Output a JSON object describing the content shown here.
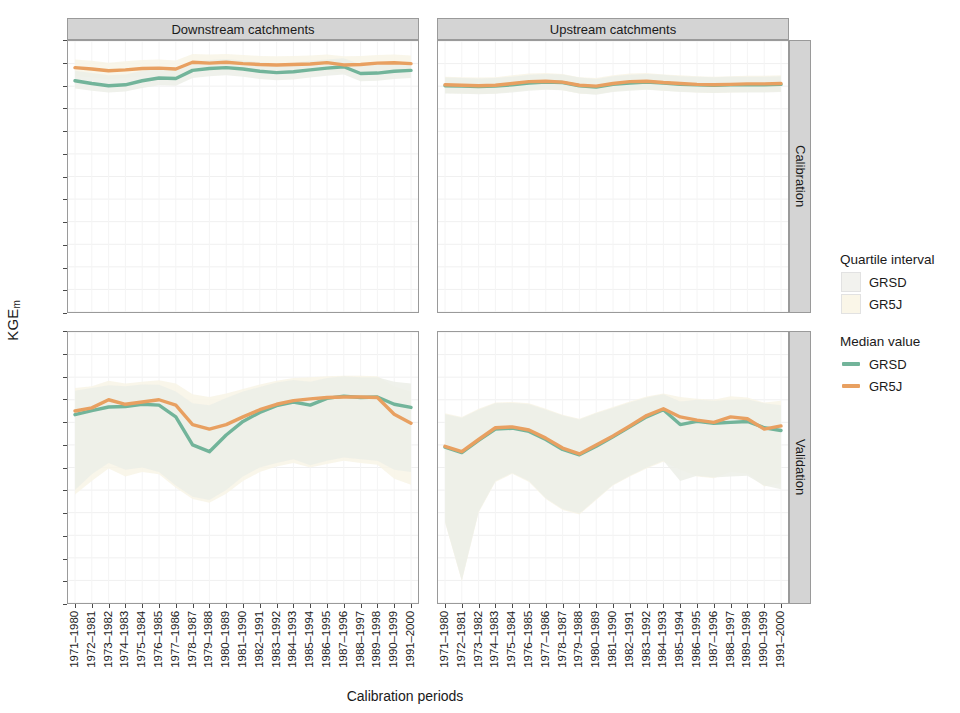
{
  "axes": {
    "ylabel_main": "KGE",
    "ylabel_sub": "m",
    "xlabel": "Calibration periods"
  },
  "strips": {
    "columns": [
      "Downstream catchments",
      "Upstream catchments"
    ],
    "rows": [
      "Calibration",
      "Validation"
    ]
  },
  "legend": {
    "quartile_title": "Quartile interval",
    "quartile_items": [
      {
        "label": "GRSD",
        "color": "#f2f2ee"
      },
      {
        "label": "GR5J",
        "color": "#faf6e8"
      }
    ],
    "median_title": "Median value",
    "median_items": [
      {
        "label": "GRSD",
        "color": "#72b49a"
      },
      {
        "label": "GR5J",
        "color": "#e8a061"
      }
    ]
  },
  "chart_data": {
    "type": "line",
    "title": "",
    "xlabel": "Calibration periods",
    "ylabel": "KGEm",
    "ylim": [
      0.35,
      0.95
    ],
    "yticks": [
      0.95,
      0.9,
      0.85,
      0.8,
      0.75,
      0.7,
      0.65,
      0.6,
      0.55,
      0.5,
      0.45,
      0.4,
      0.35
    ],
    "ytick_labels": [
      "0.95",
      "0.90",
      "0.85",
      "0.80",
      "0.75",
      "0.70",
      "0.65",
      "0.60",
      "0.55",
      "0.50",
      "0.45",
      "0.40",
      "0.35"
    ],
    "grid": true,
    "legend_position": "right",
    "categories": [
      "1971–1980",
      "1972–1981",
      "1973–1982",
      "1974–1983",
      "1975–1984",
      "1976–1985",
      "1977–1986",
      "1978–1987",
      "1979–1988",
      "1980–1989",
      "1981–1990",
      "1982–1991",
      "1983–1992",
      "1984–1993",
      "1985–1994",
      "1986–1995",
      "1987–1996",
      "1988–1997",
      "1989–1998",
      "1990–1999",
      "1991–2000"
    ],
    "panels": [
      {
        "row": "Calibration",
        "column": "Downstream catchments",
        "series": [
          {
            "name": "GRSD",
            "kind": "median",
            "color": "#72b49a",
            "values": [
              0.862,
              0.856,
              0.851,
              0.853,
              0.862,
              0.868,
              0.867,
              0.885,
              0.889,
              0.891,
              0.888,
              0.883,
              0.88,
              0.882,
              0.886,
              0.89,
              0.893,
              0.878,
              0.879,
              0.883,
              0.885
            ],
            "q1": [
              0.845,
              0.84,
              0.836,
              0.838,
              0.846,
              0.852,
              0.851,
              0.868,
              0.872,
              0.874,
              0.871,
              0.866,
              0.863,
              0.865,
              0.869,
              0.873,
              0.876,
              0.861,
              0.862,
              0.866,
              0.868
            ],
            "q3": [
              0.884,
              0.879,
              0.874,
              0.876,
              0.884,
              0.89,
              0.889,
              0.905,
              0.908,
              0.91,
              0.907,
              0.903,
              0.9,
              0.902,
              0.906,
              0.909,
              0.912,
              0.898,
              0.899,
              0.902,
              0.904
            ]
          },
          {
            "name": "GR5J",
            "kind": "median",
            "color": "#e8a061",
            "values": [
              0.891,
              0.888,
              0.884,
              0.886,
              0.889,
              0.89,
              0.888,
              0.903,
              0.901,
              0.903,
              0.9,
              0.898,
              0.897,
              0.898,
              0.899,
              0.902,
              0.897,
              0.898,
              0.901,
              0.902,
              0.9
            ],
            "q1": [
              0.872,
              0.869,
              0.865,
              0.868,
              0.871,
              0.872,
              0.87,
              0.885,
              0.883,
              0.885,
              0.882,
              0.88,
              0.879,
              0.88,
              0.881,
              0.884,
              0.879,
              0.88,
              0.883,
              0.884,
              0.882
            ],
            "q3": [
              0.909,
              0.906,
              0.902,
              0.905,
              0.908,
              0.909,
              0.907,
              0.921,
              0.92,
              0.921,
              0.919,
              0.917,
              0.916,
              0.917,
              0.918,
              0.92,
              0.916,
              0.917,
              0.919,
              0.92,
              0.918
            ]
          }
        ]
      },
      {
        "row": "Calibration",
        "column": "Upstream catchments",
        "series": [
          {
            "name": "GRSD",
            "kind": "median",
            "color": "#72b49a",
            "values": [
              0.851,
              0.85,
              0.849,
              0.85,
              0.853,
              0.857,
              0.859,
              0.858,
              0.851,
              0.848,
              0.854,
              0.857,
              0.859,
              0.857,
              0.854,
              0.853,
              0.852,
              0.853,
              0.853,
              0.853,
              0.854
            ],
            "q1": [
              0.834,
              0.833,
              0.832,
              0.833,
              0.836,
              0.84,
              0.842,
              0.841,
              0.834,
              0.831,
              0.837,
              0.84,
              0.842,
              0.84,
              0.837,
              0.836,
              0.835,
              0.836,
              0.836,
              0.836,
              0.837
            ],
            "q3": [
              0.869,
              0.868,
              0.867,
              0.868,
              0.871,
              0.875,
              0.877,
              0.876,
              0.869,
              0.866,
              0.872,
              0.875,
              0.877,
              0.875,
              0.872,
              0.871,
              0.87,
              0.871,
              0.871,
              0.871,
              0.872
            ]
          },
          {
            "name": "GR5J",
            "kind": "median",
            "color": "#e8a061",
            "values": [
              0.853,
              0.852,
              0.851,
              0.852,
              0.856,
              0.86,
              0.861,
              0.859,
              0.852,
              0.85,
              0.856,
              0.86,
              0.861,
              0.858,
              0.856,
              0.854,
              0.853,
              0.854,
              0.855,
              0.855,
              0.856
            ],
            "q1": [
              0.835,
              0.834,
              0.833,
              0.834,
              0.838,
              0.842,
              0.843,
              0.841,
              0.834,
              0.832,
              0.838,
              0.842,
              0.843,
              0.84,
              0.838,
              0.836,
              0.835,
              0.836,
              0.837,
              0.837,
              0.838
            ],
            "q3": [
              0.871,
              0.87,
              0.869,
              0.87,
              0.874,
              0.878,
              0.879,
              0.877,
              0.87,
              0.868,
              0.874,
              0.878,
              0.879,
              0.876,
              0.874,
              0.872,
              0.871,
              0.872,
              0.873,
              0.873,
              0.874
            ]
          }
        ]
      },
      {
        "row": "Validation",
        "column": "Downstream catchments",
        "series": [
          {
            "name": "GRSD",
            "kind": "median",
            "color": "#72b49a",
            "values": [
              0.767,
              0.776,
              0.784,
              0.785,
              0.79,
              0.788,
              0.762,
              0.7,
              0.685,
              0.722,
              0.752,
              0.772,
              0.787,
              0.795,
              0.788,
              0.803,
              0.808,
              0.805,
              0.806,
              0.79,
              0.783
            ],
            "q1": [
              0.6,
              0.635,
              0.66,
              0.645,
              0.65,
              0.64,
              0.61,
              0.585,
              0.578,
              0.6,
              0.63,
              0.65,
              0.66,
              0.668,
              0.655,
              0.665,
              0.672,
              0.668,
              0.665,
              0.645,
              0.64
            ],
            "q3": [
              0.82,
              0.826,
              0.832,
              0.83,
              0.834,
              0.833,
              0.818,
              0.792,
              0.788,
              0.804,
              0.818,
              0.828,
              0.838,
              0.844,
              0.84,
              0.848,
              0.852,
              0.85,
              0.85,
              0.84,
              0.836
            ]
          },
          {
            "name": "GR5J",
            "kind": "median",
            "color": "#e8a061",
            "values": [
              0.775,
              0.782,
              0.8,
              0.79,
              0.795,
              0.8,
              0.788,
              0.745,
              0.735,
              0.745,
              0.762,
              0.778,
              0.79,
              0.798,
              0.802,
              0.805,
              0.806,
              0.806,
              0.805,
              0.768,
              0.748
            ],
            "q1": [
              0.59,
              0.62,
              0.648,
              0.63,
              0.64,
              0.635,
              0.605,
              0.58,
              0.572,
              0.592,
              0.62,
              0.64,
              0.652,
              0.66,
              0.65,
              0.658,
              0.665,
              0.66,
              0.656,
              0.625,
              0.612
            ],
            "q3": [
              0.826,
              0.83,
              0.842,
              0.836,
              0.84,
              0.843,
              0.836,
              0.812,
              0.806,
              0.814,
              0.824,
              0.834,
              0.842,
              0.848,
              0.85,
              0.852,
              0.853,
              0.853,
              0.852,
              0.83,
              0.818
            ]
          }
        ]
      },
      {
        "row": "Validation",
        "column": "Upstream catchments",
        "series": [
          {
            "name": "GRSD",
            "kind": "median",
            "color": "#72b49a",
            "values": [
              0.695,
              0.683,
              0.71,
              0.735,
              0.737,
              0.73,
              0.712,
              0.69,
              0.678,
              0.697,
              0.718,
              0.74,
              0.762,
              0.778,
              0.745,
              0.752,
              0.748,
              0.75,
              0.752,
              0.738,
              0.732
            ],
            "q1": [
              0.53,
              0.4,
              0.552,
              0.62,
              0.638,
              0.62,
              0.582,
              0.558,
              0.548,
              0.58,
              0.612,
              0.632,
              0.65,
              0.665,
              0.62,
              0.632,
              0.628,
              0.63,
              0.632,
              0.61,
              0.602
            ],
            "q3": [
              0.768,
              0.76,
              0.778,
              0.792,
              0.793,
              0.79,
              0.778,
              0.765,
              0.756,
              0.77,
              0.782,
              0.794,
              0.805,
              0.812,
              0.796,
              0.8,
              0.798,
              0.8,
              0.801,
              0.792,
              0.788
            ]
          },
          {
            "name": "GR5J",
            "kind": "median",
            "color": "#e8a061",
            "values": [
              0.697,
              0.685,
              0.712,
              0.738,
              0.74,
              0.733,
              0.715,
              0.693,
              0.68,
              0.7,
              0.72,
              0.742,
              0.765,
              0.78,
              0.762,
              0.755,
              0.75,
              0.762,
              0.758,
              0.735,
              0.742
            ],
            "q1": [
              0.528,
              0.398,
              0.55,
              0.618,
              0.636,
              0.618,
              0.58,
              0.556,
              0.546,
              0.578,
              0.61,
              0.63,
              0.648,
              0.663,
              0.645,
              0.63,
              0.626,
              0.64,
              0.636,
              0.608,
              0.615
            ],
            "q3": [
              0.77,
              0.762,
              0.78,
              0.794,
              0.795,
              0.792,
              0.78,
              0.767,
              0.758,
              0.772,
              0.784,
              0.796,
              0.807,
              0.814,
              0.806,
              0.802,
              0.8,
              0.808,
              0.805,
              0.794,
              0.798
            ]
          }
        ]
      }
    ]
  }
}
